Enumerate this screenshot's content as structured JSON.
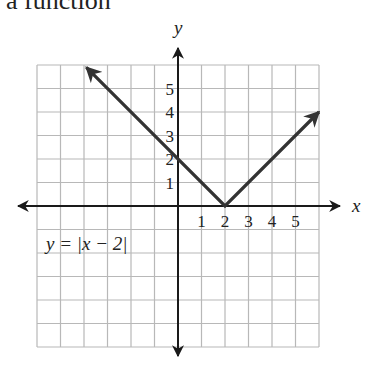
{
  "caption": "a function",
  "axes": {
    "x_label": "x",
    "y_label": "y"
  },
  "equation_label": "y = |x − 2|",
  "colors": {
    "grid": "#b8b8b8",
    "axis": "#1a1a1a",
    "line": "#333333"
  },
  "chart_data": {
    "type": "line",
    "xlabel": "x",
    "ylabel": "y",
    "xlim": [
      -6,
      6
    ],
    "ylim": [
      -6,
      6
    ],
    "grid": true,
    "x_ticks": [
      1,
      2,
      3,
      4,
      5
    ],
    "y_ticks": [
      1,
      2,
      3,
      4,
      5
    ],
    "series": [
      {
        "name": "y = |x - 2|",
        "x": [
          -4,
          -3,
          -2,
          -1,
          0,
          1,
          2,
          3,
          4,
          5,
          6
        ],
        "y": [
          6,
          5,
          4,
          3,
          2,
          1,
          0,
          1,
          2,
          3,
          4
        ]
      }
    ],
    "annotations": [
      "y = |x - 2|"
    ]
  }
}
